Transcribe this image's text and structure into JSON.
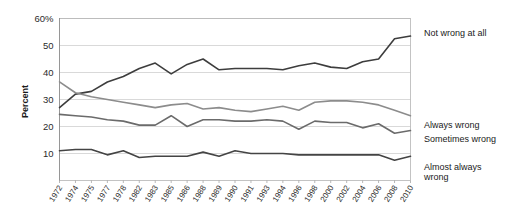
{
  "chart_data": {
    "type": "line",
    "title": "",
    "xlabel": "",
    "ylabel": "Percent",
    "ylim": [
      0,
      60
    ],
    "yticks": [
      10,
      20,
      30,
      40,
      50,
      60
    ],
    "ytick_labels": [
      "10",
      "20",
      "30",
      "40",
      "50",
      "60%"
    ],
    "grid": true,
    "legend_position": "right",
    "x": [
      1972,
      1974,
      1975,
      1977,
      1978,
      1982,
      1983,
      1985,
      1986,
      1988,
      1989,
      1990,
      1991,
      1993,
      1994,
      1996,
      1998,
      2000,
      2002,
      2004,
      2006,
      2008,
      2010
    ],
    "xtick_labels": [
      "1972",
      "1974",
      "1975",
      "1977",
      "1978",
      "1982",
      "1983",
      "1985",
      "1986",
      "1988",
      "1989",
      "1990",
      "1991",
      "1993",
      "1994",
      "1996",
      "1998",
      "2000",
      "2002",
      "2004",
      "2006",
      "2008",
      "2010"
    ],
    "series": [
      {
        "name": "Not wrong at all",
        "color": "#3d3d3d",
        "width": 1.6,
        "values": [
          27.0,
          32.0,
          33.0,
          36.5,
          38.5,
          41.5,
          43.5,
          39.5,
          43.0,
          45.0,
          41.0,
          41.5,
          41.5,
          41.5,
          41.0,
          42.5,
          43.5,
          42.0,
          41.5,
          44.0,
          45.0,
          52.5,
          53.5
        ]
      },
      {
        "name": "Always wrong",
        "color": "#8c8c8c",
        "width": 1.6,
        "values": [
          36.5,
          32.5,
          31.0,
          30.0,
          29.0,
          28.0,
          27.0,
          28.0,
          28.5,
          26.5,
          27.0,
          26.0,
          25.5,
          26.5,
          27.5,
          26.0,
          29.0,
          29.5,
          29.5,
          29.0,
          28.0,
          26.0,
          24.0
        ]
      },
      {
        "name": "Sometimes wrong",
        "color": "#6b6b6b",
        "width": 1.6,
        "values": [
          24.5,
          24.0,
          23.5,
          22.5,
          22.0,
          20.5,
          20.5,
          24.0,
          20.0,
          22.5,
          22.5,
          22.0,
          22.0,
          22.5,
          22.0,
          19.0,
          22.0,
          21.5,
          21.5,
          19.5,
          21.0,
          17.5,
          18.5
        ]
      },
      {
        "name": "Almost always wrong",
        "color": "#444444",
        "width": 1.6,
        "values": [
          11.0,
          11.5,
          11.5,
          9.5,
          11.0,
          8.5,
          9.0,
          9.0,
          9.0,
          10.5,
          9.0,
          11.0,
          10.0,
          10.0,
          10.0,
          9.5,
          9.5,
          9.5,
          9.5,
          9.5,
          9.5,
          7.5,
          9.0
        ]
      }
    ],
    "legend_labels": [
      {
        "label": "Not wrong at all",
        "line2": ""
      },
      {
        "label": "Always wrong",
        "line2": ""
      },
      {
        "label": "Sometimes wrong",
        "line2": ""
      },
      {
        "label": "Almost always",
        "line2": "wrong"
      }
    ]
  },
  "axis": {
    "y_axis_title": "Percent"
  }
}
